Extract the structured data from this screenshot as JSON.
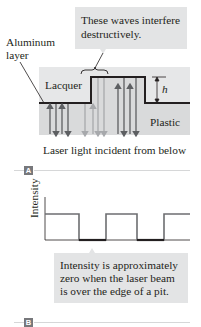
{
  "panel_a": {
    "tag": "A",
    "callout_top": {
      "line1": "These waves interfere",
      "line2": "destructively."
    },
    "aluminum_label": {
      "line1": "Aluminum",
      "line2": "layer"
    },
    "lacquer_label": "Lacquer",
    "plastic_label": "Plastic",
    "height_label": "h",
    "caption": "Laser light incident from below"
  },
  "panel_b": {
    "tag": "B",
    "y_axis_label": "Intensity",
    "callout": {
      "line1": "Intensity is approximately",
      "line2": "zero when the laser beam",
      "line3": "is over the edge of a pit."
    }
  },
  "colors": {
    "callout_bg": "#e3e4e5",
    "lacquer_bg": "#e6e7e8",
    "plastic_bg": "#d9dadb",
    "aluminum_line": "#231f20",
    "ray_dark": "#5d5f62",
    "ray_light": "#a7a9ac",
    "intensity_trace": "#6d6e71",
    "tag_bg": "#77787b"
  }
}
